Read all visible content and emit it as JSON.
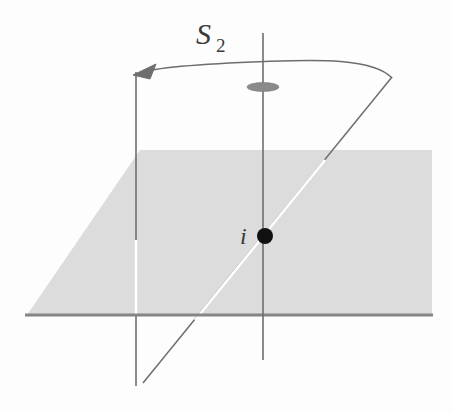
{
  "figure": {
    "background_color": "#fdfdfd",
    "width": 453,
    "height": 413
  },
  "labels": {
    "symmetry_operation": "S",
    "symmetry_order": "2",
    "point_label": "i"
  },
  "colors": {
    "plane_fill": "#dcdcdc",
    "plane_front_edge": "#858585",
    "line_stroke": "#6e6e6e",
    "hidden_line": "#ffffff",
    "point_fill": "#111111",
    "ellipse_fill": "#8a8a8a",
    "text_color": "#3a3a3a"
  },
  "geometry": {
    "plane": {
      "name": "mirror-plane",
      "shape": "parallelogram",
      "points": "140,150 432,150 432,315 27,315",
      "front_edge": {
        "x1": 25,
        "y1": 315,
        "x2": 433,
        "y2": 315,
        "width": 3
      }
    },
    "vertical_axis": {
      "name": "rotation-axis",
      "x": 263,
      "y_top": 33,
      "y_bottom": 360,
      "width": 1.6
    },
    "axis_marker_ellipse": {
      "cx": 263,
      "cy": 87,
      "rx": 16,
      "ry": 4.5
    },
    "center_point": {
      "cx": 265,
      "cy": 236,
      "r": 8
    },
    "left_vertical_line": {
      "x": 136,
      "y_top": 72,
      "y_mid_stop": 240,
      "y_resume": 315,
      "y_bottom": 386,
      "width": 1.6
    },
    "diagonal_line": {
      "x1": 392,
      "y1": 77,
      "x2": 143,
      "y2": 383,
      "hidden_segment": {
        "x1": 325,
        "y1": 160,
        "x2": 195,
        "y2": 320
      }
    },
    "arc_arrow": {
      "path": "M 392 78 C 370 58, 300 61, 265 62 C 215 63, 160 66, 140 73",
      "arrowhead": "136,72 154,66 150,80"
    },
    "label_positions": {
      "s2_x": 196,
      "s2_y": 44,
      "sub_x": 216,
      "sub_y": 52,
      "i_x": 240,
      "i_y": 244
    }
  }
}
